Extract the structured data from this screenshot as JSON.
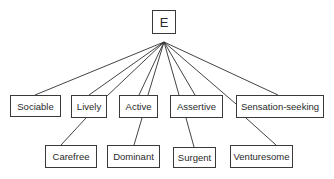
{
  "diagram": {
    "type": "hierarchy",
    "root": {
      "id": "E",
      "label": "E"
    },
    "level1": [
      {
        "id": "sociable",
        "label": "Sociable"
      },
      {
        "id": "lively",
        "label": "Lively"
      },
      {
        "id": "active",
        "label": "Active"
      },
      {
        "id": "assertive",
        "label": "Assertive"
      },
      {
        "id": "sensation-seeking",
        "label": "Sensation-seeking"
      }
    ],
    "level2": [
      {
        "id": "carefree",
        "label": "Carefree"
      },
      {
        "id": "dominant",
        "label": "Dominant"
      },
      {
        "id": "surgent",
        "label": "Surgent"
      },
      {
        "id": "venturesome",
        "label": "Venturesome"
      }
    ],
    "edges": [
      {
        "from": "E",
        "to": "sociable"
      },
      {
        "from": "E",
        "to": "lively"
      },
      {
        "from": "E",
        "to": "carefree",
        "via": "lively"
      },
      {
        "from": "E",
        "to": "active"
      },
      {
        "from": "E",
        "to": "dominant",
        "via": "active"
      },
      {
        "from": "E",
        "to": "assertive"
      },
      {
        "from": "E",
        "to": "surgent",
        "via": "assertive"
      },
      {
        "from": "E",
        "to": "sensation-seeking"
      },
      {
        "from": "E",
        "to": "venturesome",
        "via": "sensation-seeking"
      }
    ]
  }
}
